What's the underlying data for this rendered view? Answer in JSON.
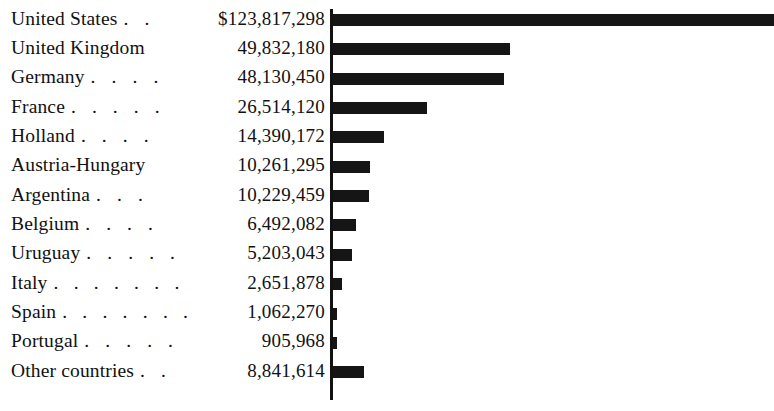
{
  "chart_data": {
    "type": "bar",
    "orientation": "horizontal",
    "title": "",
    "subtitle": "",
    "xlabel": "",
    "ylabel": "",
    "grid": false,
    "legend": null,
    "value_prefix_first_row": "$",
    "bar_color": "#151515",
    "background_color": "#ffffff",
    "axis_color": "#121212",
    "xlim": [
      0,
      123817298
    ],
    "categories": [
      "United States",
      "United Kingdom",
      "Germany",
      "France",
      "Holland",
      "Austria-Hungary",
      "Argentina",
      "Belgium",
      "Uruguay",
      "Italy",
      "Spain",
      "Portugal",
      "Other countries"
    ],
    "values": [
      123817298,
      49832180,
      48130450,
      26514120,
      14390172,
      10261295,
      10229459,
      6492082,
      5203043,
      2651878,
      1062270,
      905968,
      8841614
    ],
    "value_labels": [
      "$123,817,298",
      "49,832,180",
      "48,130,450",
      "26,514,120",
      "14,390,172",
      "10,261,295",
      "10,229,459",
      "6,492,082",
      "5,203,043",
      "2,651,878",
      "1,062,270",
      "905,968",
      "8,841,614"
    ]
  },
  "rows": [
    {
      "label": "United States",
      "leader": ". .",
      "value": "$123,817,298",
      "amount": 123817298
    },
    {
      "label": "United Kingdom",
      "leader": "",
      "value": "49,832,180",
      "amount": 49832180
    },
    {
      "label": "Germany",
      "leader": ". . . .",
      "value": "48,130,450",
      "amount": 48130450
    },
    {
      "label": "France",
      "leader": ". . . . .",
      "value": "26,514,120",
      "amount": 26514120
    },
    {
      "label": "Holland",
      "leader": ". . . .",
      "value": "14,390,172",
      "amount": 14390172
    },
    {
      "label": "Austria-Hungary",
      "leader": "",
      "value": "10,261,295",
      "amount": 10261295
    },
    {
      "label": "Argentina",
      "leader": ". . .",
      "value": "10,229,459",
      "amount": 10229459
    },
    {
      "label": "Belgium",
      "leader": ". . . .",
      "value": "6,492,082",
      "amount": 6492082
    },
    {
      "label": "Uruguay",
      "leader": ". . . . .",
      "value": "5,203,043",
      "amount": 5203043
    },
    {
      "label": "Italy",
      "leader": ". . . . . . .",
      "value": "2,651,878",
      "amount": 2651878
    },
    {
      "label": "Spain",
      "leader": ". . . . . . .",
      "value": "1,062,270",
      "amount": 1062270
    },
    {
      "label": "Portugal",
      "leader": ". . . . .",
      "value": "905,968",
      "amount": 905968
    },
    {
      "label": "Other countries",
      "leader": ". .",
      "value": "8,841,614",
      "amount": 8841614
    }
  ]
}
